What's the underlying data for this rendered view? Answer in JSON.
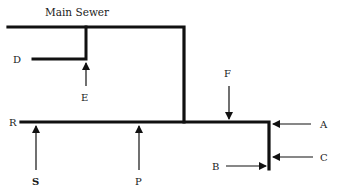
{
  "title": "Main Sewer",
  "labels": {
    "A": "A",
    "B": "B",
    "C": "C",
    "D": "D",
    "E": "E",
    "F": "F",
    "P": "P",
    "R": "R",
    "S": "S"
  },
  "colors": {
    "line": "#111111",
    "background": "#ffffff"
  }
}
